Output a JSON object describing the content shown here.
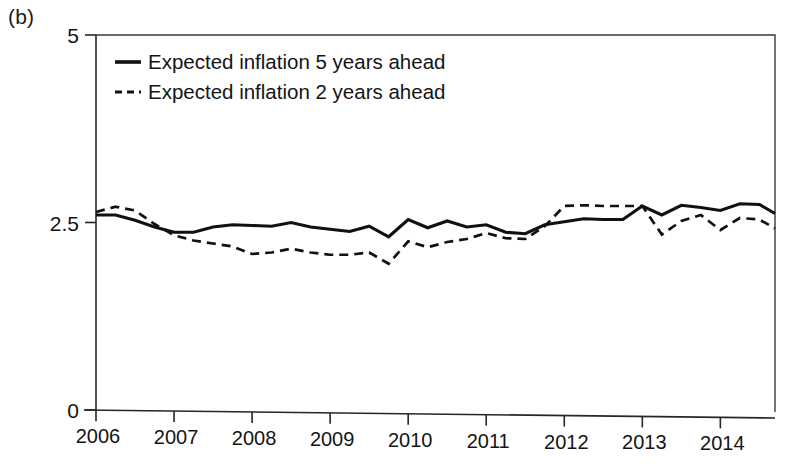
{
  "panel": {
    "label": "(b)"
  },
  "chart_data": {
    "type": "line",
    "title": "",
    "subtitle": "",
    "xlabel": "",
    "ylabel": "",
    "xlim": [
      2006.0,
      2014.7
    ],
    "ylim": [
      0,
      5
    ],
    "yticks": [
      0,
      2.5,
      5
    ],
    "ytick_labels": [
      "0",
      "2.5",
      "5"
    ],
    "xticks": [
      2006,
      2007,
      2008,
      2009,
      2010,
      2011,
      2012,
      2013,
      2014
    ],
    "xtick_labels": [
      "2006",
      "2007",
      "2008",
      "2009",
      "2010",
      "2011",
      "2012",
      "2013",
      "2014"
    ],
    "grid": false,
    "legend_position": "top-left",
    "legend": [
      "Expected inflation 5 years ahead",
      "Expected inflation 2 years ahead"
    ],
    "series": [
      {
        "name": "Expected inflation 5 years ahead",
        "style": "solid",
        "x": [
          2006.0,
          2006.25,
          2006.5,
          2006.75,
          2007.0,
          2007.25,
          2007.5,
          2007.75,
          2008.0,
          2008.25,
          2008.5,
          2008.75,
          2009.0,
          2009.25,
          2009.5,
          2009.75,
          2010.0,
          2010.25,
          2010.5,
          2010.75,
          2011.0,
          2011.25,
          2011.5,
          2011.75,
          2012.0,
          2012.25,
          2012.5,
          2012.75,
          2013.0,
          2013.25,
          2013.5,
          2013.75,
          2014.0,
          2014.25,
          2014.5,
          2014.7
        ],
        "values": [
          2.6,
          2.6,
          2.53,
          2.44,
          2.37,
          2.37,
          2.44,
          2.47,
          2.46,
          2.45,
          2.5,
          2.44,
          2.41,
          2.38,
          2.45,
          2.31,
          2.54,
          2.43,
          2.52,
          2.44,
          2.47,
          2.37,
          2.35,
          2.47,
          2.51,
          2.55,
          2.54,
          2.54,
          2.72,
          2.6,
          2.73,
          2.7,
          2.66,
          2.75,
          2.74,
          2.62
        ]
      },
      {
        "name": "Expected inflation 2 years ahead",
        "style": "dashed",
        "x": [
          2006.0,
          2006.25,
          2006.5,
          2006.75,
          2007.0,
          2007.25,
          2007.5,
          2007.75,
          2008.0,
          2008.25,
          2008.5,
          2008.75,
          2009.0,
          2009.25,
          2009.5,
          2009.75,
          2010.0,
          2010.25,
          2010.5,
          2010.75,
          2011.0,
          2011.25,
          2011.5,
          2011.75,
          2012.0,
          2012.25,
          2012.5,
          2012.75,
          2013.0,
          2013.25,
          2013.5,
          2013.75,
          2014.0,
          2014.25,
          2014.5,
          2014.7
        ],
        "values": [
          2.64,
          2.71,
          2.66,
          2.48,
          2.33,
          2.26,
          2.22,
          2.18,
          2.08,
          2.1,
          2.15,
          2.1,
          2.07,
          2.07,
          2.1,
          1.95,
          2.25,
          2.17,
          2.24,
          2.28,
          2.36,
          2.29,
          2.28,
          2.45,
          2.72,
          2.73,
          2.72,
          2.72,
          2.72,
          2.34,
          2.52,
          2.6,
          2.4,
          2.56,
          2.54,
          2.42
        ]
      }
    ]
  }
}
